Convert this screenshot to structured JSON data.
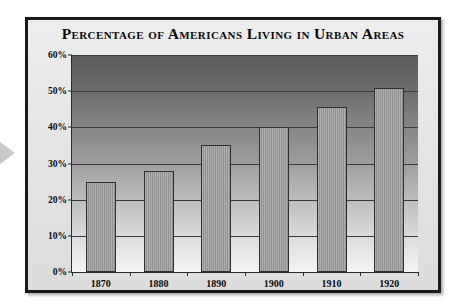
{
  "chart_data": {
    "type": "bar",
    "title": "Percentage of Americans Living in Urban Areas",
    "xlabel": "",
    "ylabel": "",
    "categories": [
      "1870",
      "1880",
      "1890",
      "1900",
      "1910",
      "1920"
    ],
    "values": [
      25,
      28,
      35,
      40,
      45.5,
      51
    ],
    "ylim": [
      0,
      60
    ],
    "ytick_labels": [
      "0%",
      "10%",
      "20%",
      "30%",
      "40%",
      "50%",
      "60%"
    ],
    "ytick_values": [
      0,
      10,
      20,
      30,
      40,
      50,
      60
    ],
    "grid": true,
    "legend": "none",
    "bar_color": "#9a9a9a",
    "bar_border_color": "#2e2e2e",
    "gridline_color": "#3a3a3a",
    "plot_background": "vertical gradient dark-gray to white",
    "frame_color": "#1a1a1a",
    "card_background": "#e6e6e6",
    "text_color": "#0b0b0b"
  },
  "decoration": {
    "left_marker": "triangle-right-marker",
    "left_marker_color": "#c9c9c9"
  }
}
